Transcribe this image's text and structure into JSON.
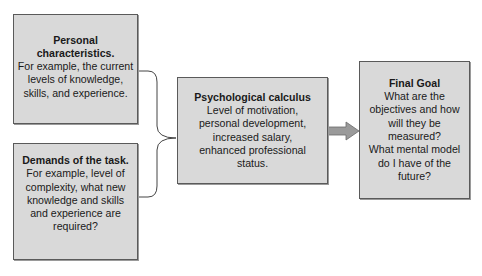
{
  "diagram": {
    "boxes": {
      "personal": {
        "title": "Personal characteristics.",
        "body": "For example, the  current\nlevels of knowledge,\nskills, and experience."
      },
      "demands": {
        "title": "Demands of the task.",
        "body": "For example, level of\ncomplexity, what new\nknowledge and skills\nand experience are\nrequired?"
      },
      "calculus": {
        "title": "Psychological calculus",
        "body": "Level of motivation,\npersonal development,\nincreased salary,\nenhanced professional\nstatus."
      },
      "goal": {
        "title": "Final Goal",
        "body": "What are the\nobjectives and how\nwill they be\nmeasured?\nWhat mental model\ndo I have of the\nfuture?"
      }
    },
    "connectors": {
      "brace": "merge-brace",
      "arrow": "right-arrow"
    },
    "colors": {
      "box_fill": "#d9d9d9",
      "box_border": "#5a5a5a",
      "arrow_fill": "#9a9a9a",
      "line": "#444444"
    }
  }
}
